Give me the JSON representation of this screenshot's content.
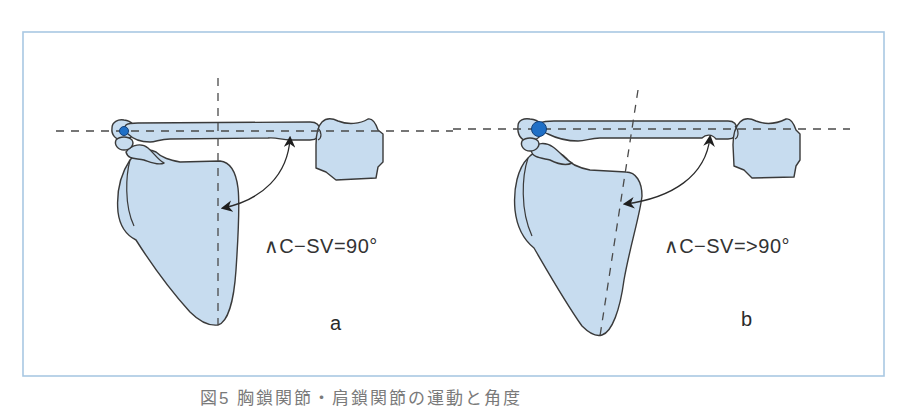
{
  "figure": {
    "frame_color": "#a9c8e3",
    "bone_fill": "#c7dcef",
    "joint_color": "#1f6fc6",
    "panels": [
      {
        "id": "a",
        "letter": "a",
        "angle_label": "∧C−SV=90°",
        "angle_value": "90°",
        "description": "Clavicle-scapular vertebral border angle equals 90 degrees; vertical reference line perpendicular to clavicle axis",
        "joint_dot_size": "small"
      },
      {
        "id": "b",
        "letter": "b",
        "angle_label": "∧C−SV=>90°",
        "angle_value": ">90°",
        "description": "Clavicle-scapular vertebral border angle greater than 90 degrees; scapular reference line tilted",
        "joint_dot_size": "large"
      }
    ],
    "caption": "図5 胸鎖関節・肩鎖関節の運動と角度"
  }
}
